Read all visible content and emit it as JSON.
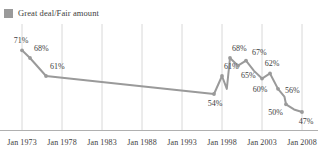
{
  "legend": {
    "label": "Great deal/Fair amount",
    "swatch_color": "#9a9a9a",
    "position": "top-left"
  },
  "axis": {
    "tick_labels": [
      "Jan 1973",
      "Jan 1978",
      "Jan 1983",
      "Jan 1988",
      "Jan 1993",
      "Jan 1998",
      "Jan 2003",
      "Jan 2008"
    ],
    "baseline_color": "#b0b0b0",
    "gridline_color": "#d8d8d8"
  },
  "chart_data": {
    "type": "line",
    "title": "",
    "subtitle": "",
    "xlabel": "",
    "ylabel": "",
    "ylim": [
      40,
      75
    ],
    "xlim": [
      1973,
      2008
    ],
    "grid": "vertical",
    "legend_position": "top-left",
    "line_color": "#9a9a9a",
    "marker_color": "#9a9a9a",
    "series": [
      {
        "name": "Great deal/Fair amount",
        "x": [
          1973,
          1974,
          1976,
          1985,
          1997,
          1998,
          1998.6,
          1999,
          2000,
          2001,
          2002,
          2003,
          2004,
          2005,
          2005.8,
          2006,
          2007,
          2008
        ],
        "values": [
          71,
          68,
          61,
          58,
          54,
          61,
          56,
          68,
          65,
          67,
          63,
          60,
          62,
          56,
          53,
          50,
          48,
          47
        ],
        "labeled_points": [
          {
            "x": 1973,
            "value": 71,
            "label": "71%"
          },
          {
            "x": 1974,
            "value": 68,
            "label": "68%"
          },
          {
            "x": 1976,
            "value": 61,
            "label": "61%"
          },
          {
            "x": 1997,
            "value": 54,
            "label": "54%"
          },
          {
            "x": 1998,
            "value": 61,
            "label": "61%"
          },
          {
            "x": 1999,
            "value": 68,
            "label": "68%"
          },
          {
            "x": 2000,
            "value": 65,
            "label": "65%"
          },
          {
            "x": 2001,
            "value": 67,
            "label": "67%"
          },
          {
            "x": 2004,
            "value": 62,
            "label": "62%"
          },
          {
            "x": 2003,
            "value": 60,
            "label": "60%"
          },
          {
            "x": 2005,
            "value": 56,
            "label": "56%"
          },
          {
            "x": 2006,
            "value": 50,
            "label": "50%"
          },
          {
            "x": 2008,
            "value": 47,
            "label": "47%"
          }
        ]
      }
    ]
  }
}
